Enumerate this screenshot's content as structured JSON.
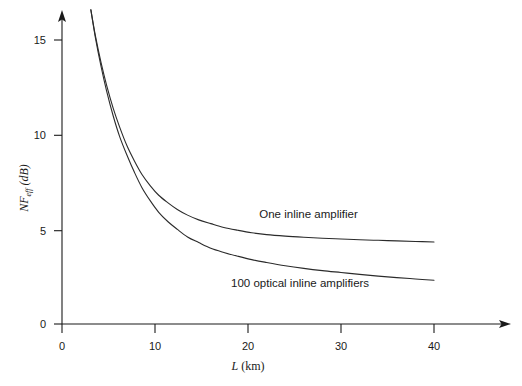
{
  "chart_data": {
    "type": "line",
    "title": "",
    "xlabel": "L (km)",
    "ylabel": "NF_eff (dB)",
    "ylabel_parts": {
      "main": "NF",
      "subscript": "eff",
      "unit": "(dB)"
    },
    "xlabel_parts": {
      "symbol": "L",
      "unit": "(km)"
    },
    "xlim": [
      0,
      47
    ],
    "ylim": [
      0,
      17.2
    ],
    "xticks": [
      0,
      10,
      20,
      30,
      40
    ],
    "xtick_labels": [
      "0",
      "10",
      "20",
      "30",
      "40"
    ],
    "yticks": [
      0,
      5,
      10,
      15
    ],
    "ytick_labels": [
      "0",
      "5",
      "10",
      "15"
    ],
    "grid": false,
    "legend": "inline-annotations",
    "series": [
      {
        "name": "One inline amplifier",
        "label": "One inline amplifier",
        "label_x": 26.5,
        "label_y": 5.6,
        "x": [
          3.1,
          3.6,
          4.2,
          4.8,
          5.5,
          6.2,
          7.0,
          7.8,
          8.6,
          9.5,
          10.4,
          11.4,
          12.4,
          13.5,
          14.7,
          16.0,
          17.4,
          18.9,
          20.4,
          22.0,
          24.0,
          26.0,
          28.0,
          30.0,
          32.0,
          34.0,
          36.0,
          38.0,
          40.0
        ],
        "y": [
          16.6,
          15.2,
          13.8,
          12.6,
          11.4,
          10.4,
          9.4,
          8.6,
          7.9,
          7.3,
          6.8,
          6.4,
          6.05,
          5.75,
          5.5,
          5.3,
          5.1,
          4.95,
          4.82,
          4.72,
          4.64,
          4.58,
          4.53,
          4.49,
          4.45,
          4.42,
          4.39,
          4.36,
          4.33
        ]
      },
      {
        "name": "100 optical inline amplifiers",
        "label": "100 optical inline amplifiers",
        "label_x": 25.6,
        "label_y": 1.95,
        "x": [
          3.1,
          3.6,
          4.2,
          4.8,
          5.5,
          6.2,
          7.0,
          7.8,
          8.6,
          9.5,
          10.4,
          11.4,
          12.4,
          13.5,
          14.7,
          16.0,
          17.4,
          18.9,
          20.4,
          22.0,
          24.0,
          26.0,
          28.0,
          30.0,
          32.0,
          34.0,
          36.0,
          38.0,
          40.0
        ],
        "y": [
          16.6,
          15.1,
          13.6,
          12.3,
          11.0,
          9.9,
          8.9,
          8.0,
          7.2,
          6.5,
          5.9,
          5.4,
          5.0,
          4.6,
          4.3,
          4.0,
          3.78,
          3.58,
          3.4,
          3.25,
          3.08,
          2.94,
          2.82,
          2.72,
          2.62,
          2.53,
          2.45,
          2.38,
          2.31
        ]
      }
    ]
  },
  "axes": {
    "x_arrow": "arrowhead-right",
    "y_arrow": "arrowhead-up"
  }
}
